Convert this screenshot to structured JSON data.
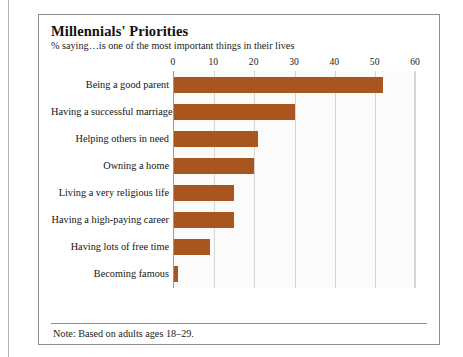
{
  "figure": {
    "title": "Millennials' Priorities",
    "subtitle": "% saying…is one of the most important things in their lives",
    "note": "Note: Based on adults ages 18–29."
  },
  "colors": {
    "bar": "#a8551e",
    "frame": "#8d8d8d",
    "gridline": "#d6d6d6",
    "plot_background": "#fbfbfb"
  },
  "chart_data": {
    "type": "bar",
    "orientation": "horizontal",
    "title": "Millennials' Priorities",
    "subtitle": "% saying…is one of the most important things in their lives",
    "xlabel": "",
    "ylabel": "",
    "xlim": [
      0,
      60
    ],
    "xticks": [
      0,
      10,
      20,
      30,
      40,
      50,
      60
    ],
    "xtick_labels": [
      "0",
      "10",
      "20",
      "30",
      "40",
      "50",
      "60"
    ],
    "grid": true,
    "axis_position": "top",
    "legend": "none",
    "annotation": "Note: Based on adults ages 18–29.",
    "categories": [
      "Being a good parent",
      "Having a successful marriage",
      "Helping others in need",
      "Owning a home",
      "Living a very religious life",
      "Having a high-paying career",
      "Having lots of free time",
      "Becoming famous"
    ],
    "values": [
      52,
      30,
      21,
      20,
      15,
      15,
      9,
      1
    ],
    "series": [
      {
        "name": "% saying one of the most important things",
        "values": [
          52,
          30,
          21,
          20,
          15,
          15,
          9,
          1
        ]
      }
    ]
  }
}
